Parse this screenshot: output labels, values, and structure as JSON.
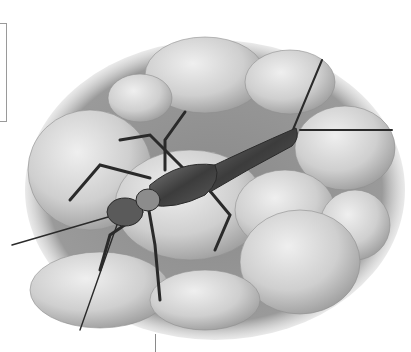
{
  "illustration": {
    "subject": "stonefly nymph on river stones",
    "style": "grayscale pencil illustration",
    "colors": {
      "background": "#ffffff",
      "stone_light": "#d9d9d9",
      "stone_mid": "#bdbdbd",
      "moss_dark": "#6e6e6e",
      "insect_body": "#4a4a4a",
      "insect_highlight": "#8c8c8c"
    }
  }
}
